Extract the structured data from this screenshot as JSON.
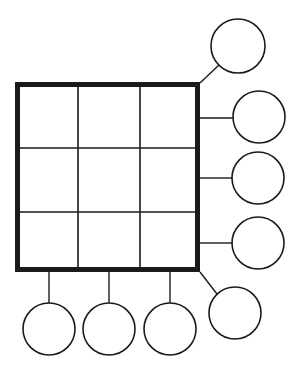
{
  "canvas": {
    "width": 302,
    "height": 380,
    "background_color": "#ffffff",
    "title": "Blank grid and circles worksheet diagram"
  },
  "style": {
    "stroke_color": "#1a1a1a",
    "fill_color": "#ffffff",
    "outer_border_width": 5,
    "inner_grid_line_width": 1.6,
    "circle_stroke_width": 1.6,
    "connector_stroke_width": 1.4
  },
  "grid": {
    "label": "3x3 grid",
    "x": 15,
    "y": 82,
    "width": 185,
    "height": 190,
    "rows": 3,
    "columns": 3,
    "cells": [
      {
        "id": "cell-r1c1",
        "label": "",
        "x": 18,
        "y": 85,
        "width": 60,
        "height": 63
      },
      {
        "id": "cell-r1c2",
        "label": "",
        "x": 78,
        "y": 85,
        "width": 62,
        "height": 63
      },
      {
        "id": "cell-r1c3",
        "label": "",
        "x": 140,
        "y": 85,
        "width": 57,
        "height": 63
      },
      {
        "id": "cell-r2c1",
        "label": "",
        "x": 18,
        "y": 148,
        "width": 60,
        "height": 64
      },
      {
        "id": "cell-r2c2",
        "label": "",
        "x": 78,
        "y": 148,
        "width": 62,
        "height": 64
      },
      {
        "id": "cell-r2c3",
        "label": "",
        "x": 140,
        "y": 148,
        "width": 57,
        "height": 64
      },
      {
        "id": "cell-r3c1",
        "label": "",
        "x": 18,
        "y": 212,
        "width": 60,
        "height": 57
      },
      {
        "id": "cell-r3c2",
        "label": "",
        "x": 78,
        "y": 212,
        "width": 62,
        "height": 57
      },
      {
        "id": "cell-r3c3",
        "label": "",
        "x": 140,
        "y": 212,
        "width": 57,
        "height": 57
      }
    ],
    "inner_vertical_lines_x": [
      78,
      140
    ],
    "inner_horizontal_lines_y": [
      148,
      212
    ]
  },
  "circles": [
    {
      "id": "circle-top-right",
      "label": "",
      "position": "top-right-diagonal",
      "cx": 238,
      "cy": 46,
      "r": 27
    },
    {
      "id": "circle-right-1",
      "label": "",
      "position": "right-upper",
      "cx": 259,
      "cy": 117,
      "r": 26
    },
    {
      "id": "circle-right-2",
      "label": "",
      "position": "right-middle",
      "cx": 258,
      "cy": 178,
      "r": 26
    },
    {
      "id": "circle-right-3",
      "label": "",
      "position": "right-lower",
      "cx": 258,
      "cy": 243,
      "r": 26
    },
    {
      "id": "circle-bottom-right",
      "label": "",
      "position": "bottom-right-diagonal",
      "cx": 235,
      "cy": 313,
      "r": 26
    },
    {
      "id": "circle-bottom-1",
      "label": "",
      "position": "bottom-left",
      "cx": 49,
      "cy": 329,
      "r": 26
    },
    {
      "id": "circle-bottom-2",
      "label": "",
      "position": "bottom-center",
      "cx": 109,
      "cy": 329,
      "r": 26
    },
    {
      "id": "circle-bottom-3",
      "label": "",
      "position": "bottom-right-of-center",
      "cx": 170,
      "cy": 329,
      "r": 26
    }
  ],
  "connectors": [
    {
      "id": "connector-top-right",
      "type": "diagonal",
      "x1": 200,
      "y1": 83,
      "x2": 220,
      "y2": 64
    },
    {
      "id": "connector-right-1",
      "type": "horizontal",
      "x1": 200,
      "y1": 118,
      "x2": 233,
      "y2": 118
    },
    {
      "id": "connector-right-2",
      "type": "horizontal",
      "x1": 200,
      "y1": 178,
      "x2": 232,
      "y2": 178
    },
    {
      "id": "connector-right-3",
      "type": "horizontal",
      "x1": 200,
      "y1": 243,
      "x2": 232,
      "y2": 243
    },
    {
      "id": "connector-bottom-right",
      "type": "diagonal",
      "x1": 200,
      "y1": 272,
      "x2": 217,
      "y2": 294
    },
    {
      "id": "connector-bottom-1",
      "type": "vertical",
      "x1": 49,
      "y1": 272,
      "x2": 49,
      "y2": 303
    },
    {
      "id": "connector-bottom-2",
      "type": "vertical",
      "x1": 109,
      "y1": 272,
      "x2": 109,
      "y2": 303
    },
    {
      "id": "connector-bottom-3",
      "type": "vertical",
      "x1": 170,
      "y1": 272,
      "x2": 170,
      "y2": 303
    }
  ]
}
